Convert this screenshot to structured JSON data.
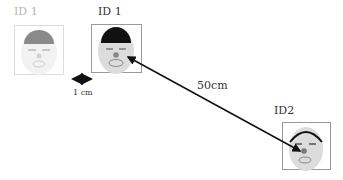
{
  "diagram": {
    "faces": [
      {
        "id": "ID 1",
        "state": "faded",
        "hair": "#8a8a8a",
        "skin": "#f2f2f2",
        "nose": "#d0d0d0"
      },
      {
        "id": "ID 1",
        "state": "normal",
        "hair": "#111111",
        "skin": "#dcdcdc",
        "nose": "#888888"
      },
      {
        "id": "ID2",
        "state": "normal",
        "hair": "#111111",
        "skin": "#dcdcdc",
        "nose": "#777777"
      }
    ],
    "distances": [
      {
        "label": "1 cm",
        "between": "ID 1 (faded) and ID 1"
      },
      {
        "label": "50cm",
        "between": "ID 1 and ID2"
      }
    ]
  }
}
